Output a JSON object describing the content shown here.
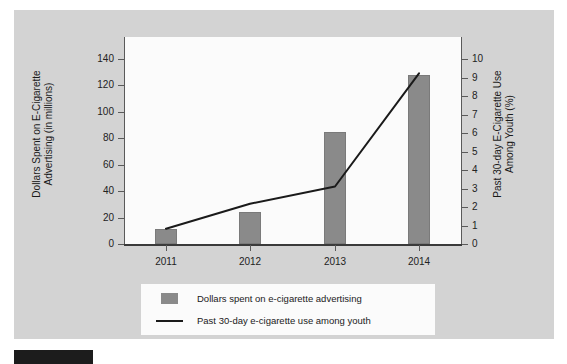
{
  "chart_data": {
    "type": "bar",
    "title": "",
    "subtitle": "",
    "categories": [
      "2011",
      "2012",
      "2013",
      "2014"
    ],
    "xlabel": "",
    "grid": false,
    "legend_position": "bottom",
    "series": [
      {
        "name": "Dollars spent on e-cigarette advertising",
        "type": "bar",
        "axis": "left",
        "values": [
          10.6,
          23.5,
          81,
          122.6
        ],
        "color": "#8a8a8a"
      },
      {
        "name": "Past 30-day e-cigarette use among youth",
        "type": "line",
        "axis": "right",
        "values": [
          0.8,
          2.1,
          3.0,
          8.9
        ],
        "color": "#1a1a1a"
      }
    ],
    "left_axis": {
      "label": "Dollars Spent on E-Cigarette\nAdvertising (in millions)",
      "ticks": [
        0,
        20,
        40,
        60,
        80,
        100,
        120,
        140
      ],
      "ylim": [
        0,
        150
      ]
    },
    "right_axis": {
      "label": "Past 30-day E-Cigarette Use\nAmong Youth (%)",
      "ticks": [
        0,
        1,
        2,
        3,
        4,
        5,
        6,
        7,
        8,
        9,
        10
      ],
      "ylim": [
        0,
        10.8
      ]
    }
  },
  "legend": {
    "items": [
      {
        "label": "Dollars spent on e-cigarette advertising",
        "marker": "bar-swatch"
      },
      {
        "label": "Past 30-day e-cigarette use among youth",
        "marker": "line-swatch"
      }
    ]
  },
  "colors": {
    "panel_background": "#d3d3d3",
    "plot_background": "#fbfbfb",
    "bar": "#8a8a8a",
    "line": "#1a1a1a",
    "axis": "#5a5a5a",
    "text": "#1a1a1a"
  }
}
